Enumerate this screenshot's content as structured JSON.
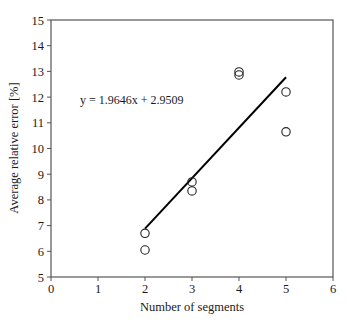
{
  "chart_data": {
    "type": "scatter",
    "title": "",
    "xlabel": "Number of segments",
    "ylabel": "Average relative error [%]",
    "xlim": [
      0,
      6
    ],
    "ylim": [
      5,
      15
    ],
    "xticks": [
      0,
      1,
      2,
      3,
      4,
      5,
      6
    ],
    "yticks": [
      5,
      6,
      7,
      8,
      9,
      10,
      11,
      12,
      13,
      14,
      15
    ],
    "grid": false,
    "legend": null,
    "series": [
      {
        "name": "data",
        "marker": "open-circle",
        "points": [
          {
            "x": 2,
            "y": 6.7
          },
          {
            "x": 2,
            "y": 6.05
          },
          {
            "x": 3,
            "y": 8.7
          },
          {
            "x": 3,
            "y": 8.35
          },
          {
            "x": 4,
            "y": 12.98
          },
          {
            "x": 4,
            "y": 12.86
          },
          {
            "x": 5,
            "y": 12.2
          },
          {
            "x": 5,
            "y": 10.65
          }
        ]
      },
      {
        "name": "linear fit",
        "type": "line",
        "slope": 1.9646,
        "intercept": 2.9509,
        "x_range": [
          2,
          5
        ]
      }
    ],
    "annotations": [
      {
        "text": "y = 1.9646x + 2.9509",
        "x": 0.6,
        "y": 12.0
      }
    ]
  },
  "labels": {
    "xlabel": "Number of segments",
    "ylabel": "Average relative error [%]",
    "equation": "y = 1.9646x + 2.9509"
  },
  "colors": {
    "axis": "#555555",
    "line": "#000000",
    "marker": "#222222",
    "text": "#1a1a1a"
  }
}
